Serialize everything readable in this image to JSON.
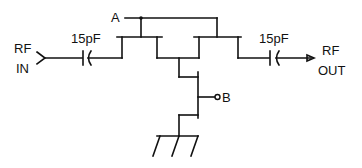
{
  "diagram": {
    "type": "circuit-schematic",
    "title": "",
    "labels": {
      "rf_in_line1": "RF",
      "rf_in_line2": "IN",
      "rf_out_line1": "RF",
      "rf_out_line2": "OUT",
      "cap_in_value": "15pF",
      "cap_out_value": "15pF",
      "node_a": "A",
      "node_b": "B"
    },
    "components": [
      {
        "id": "C1",
        "type": "capacitor",
        "value": "15pF",
        "position": "input"
      },
      {
        "id": "C2",
        "type": "capacitor",
        "value": "15pF",
        "position": "output"
      },
      {
        "id": "Q1",
        "type": "FET",
        "position": "series-left"
      },
      {
        "id": "Q2",
        "type": "FET",
        "position": "series-right"
      },
      {
        "id": "Q3",
        "type": "FET",
        "position": "shunt-upper"
      },
      {
        "id": "Q4",
        "type": "FET",
        "position": "shunt-lower"
      },
      {
        "id": "GND",
        "type": "ground"
      }
    ],
    "colors": {
      "stroke": "#111111",
      "background": "#ffffff"
    }
  }
}
